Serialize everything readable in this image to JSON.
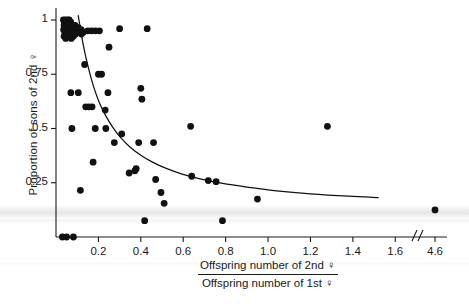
{
  "chart_data": {
    "type": "scatter",
    "title": "",
    "xlabel_numerator": "Offspring number of 2nd ♀",
    "xlabel_denominator": "Offspring number of 1st ♀",
    "ylabel": "Proportion of sons of 2nd ♀",
    "xlim": [
      0.0,
      1.74
    ],
    "ylim": [
      0.0,
      1.06
    ],
    "grid": false,
    "legend": null,
    "axis_break": {
      "symbol": "//",
      "after_tick": 1.6,
      "resumed_tick": 4.6,
      "note": "x-axis is broken between 1.6 and 4.6"
    },
    "xticks": [
      0.2,
      0.4,
      0.6,
      0.8,
      1.0,
      1.2,
      1.4,
      1.6,
      4.6
    ],
    "xtick_labels": [
      "0.2",
      "0.4",
      "0.6",
      "0.8",
      "1.0",
      "1.2",
      "1.4",
      "1.6",
      "4.6"
    ],
    "yticks": [
      0.25,
      0.5,
      0.75,
      1
    ],
    "ytick_labels": [
      "0.25",
      "0.5",
      "0.75",
      "1"
    ],
    "marker": {
      "shape": "circle",
      "color": "#111111",
      "size": 3.4
    },
    "points": [
      [
        0.035,
        1.0
      ],
      [
        0.045,
        1.0
      ],
      [
        0.055,
        1.0
      ],
      [
        0.062,
        1.0
      ],
      [
        0.04,
        0.99
      ],
      [
        0.05,
        0.99
      ],
      [
        0.07,
        0.99
      ],
      [
        0.038,
        0.975
      ],
      [
        0.058,
        0.975
      ],
      [
        0.078,
        0.975
      ],
      [
        0.09,
        0.975
      ],
      [
        0.045,
        0.965
      ],
      [
        0.066,
        0.965
      ],
      [
        0.086,
        0.965
      ],
      [
        0.105,
        0.965
      ],
      [
        0.036,
        0.955
      ],
      [
        0.056,
        0.955
      ],
      [
        0.075,
        0.955
      ],
      [
        0.098,
        0.955
      ],
      [
        0.118,
        0.955
      ],
      [
        0.042,
        0.945
      ],
      [
        0.062,
        0.945
      ],
      [
        0.084,
        0.945
      ],
      [
        0.108,
        0.945
      ],
      [
        0.13,
        0.945
      ],
      [
        0.15,
        0.95
      ],
      [
        0.168,
        0.95
      ],
      [
        0.186,
        0.95
      ],
      [
        0.205,
        0.95
      ],
      [
        0.048,
        0.935
      ],
      [
        0.07,
        0.935
      ],
      [
        0.092,
        0.935
      ],
      [
        0.12,
        0.935
      ],
      [
        0.038,
        0.925
      ],
      [
        0.06,
        0.925
      ],
      [
        0.082,
        0.925
      ],
      [
        0.046,
        0.915
      ],
      [
        0.072,
        0.915
      ],
      [
        0.3,
        0.96
      ],
      [
        0.43,
        0.96
      ],
      [
        0.25,
        0.875
      ],
      [
        0.135,
        0.795
      ],
      [
        0.2,
        0.75
      ],
      [
        0.215,
        0.75
      ],
      [
        0.07,
        0.665
      ],
      [
        0.105,
        0.665
      ],
      [
        0.4,
        0.685
      ],
      [
        0.405,
        0.635
      ],
      [
        0.245,
        0.665
      ],
      [
        0.14,
        0.6
      ],
      [
        0.155,
        0.6
      ],
      [
        0.17,
        0.6
      ],
      [
        0.232,
        0.585
      ],
      [
        0.075,
        0.5
      ],
      [
        0.185,
        0.5
      ],
      [
        0.235,
        0.5
      ],
      [
        0.31,
        0.475
      ],
      [
        0.275,
        0.435
      ],
      [
        0.39,
        0.435
      ],
      [
        0.46,
        0.435
      ],
      [
        0.635,
        0.51
      ],
      [
        0.175,
        0.345
      ],
      [
        0.345,
        0.295
      ],
      [
        0.372,
        0.305
      ],
      [
        0.378,
        0.315
      ],
      [
        0.47,
        0.265
      ],
      [
        0.64,
        0.28
      ],
      [
        0.718,
        0.26
      ],
      [
        0.755,
        0.255
      ],
      [
        0.115,
        0.215
      ],
      [
        0.495,
        0.205
      ],
      [
        0.51,
        0.155
      ],
      [
        0.418,
        0.075
      ],
      [
        0.785,
        0.075
      ],
      [
        0.95,
        0.175
      ],
      [
        1.28,
        0.51
      ],
      [
        4.6,
        0.125
      ],
      [
        0.03,
        0.0
      ],
      [
        0.05,
        0.0
      ],
      [
        0.082,
        0.0
      ]
    ],
    "fit_curve": {
      "style": "solid",
      "color": "#111111",
      "description": "decreasing concave fitted regression curve",
      "points": [
        [
          0.105,
          1.02
        ],
        [
          0.12,
          0.93
        ],
        [
          0.138,
          0.84
        ],
        [
          0.158,
          0.76
        ],
        [
          0.18,
          0.685
        ],
        [
          0.205,
          0.618
        ],
        [
          0.235,
          0.558
        ],
        [
          0.268,
          0.505
        ],
        [
          0.305,
          0.458
        ],
        [
          0.35,
          0.414
        ],
        [
          0.4,
          0.377
        ],
        [
          0.455,
          0.345
        ],
        [
          0.52,
          0.316
        ],
        [
          0.595,
          0.29
        ],
        [
          0.68,
          0.268
        ],
        [
          0.78,
          0.248
        ],
        [
          0.9,
          0.23
        ],
        [
          1.04,
          0.213
        ],
        [
          1.2,
          0.199
        ],
        [
          1.38,
          0.188
        ],
        [
          1.52,
          0.182
        ]
      ]
    }
  }
}
